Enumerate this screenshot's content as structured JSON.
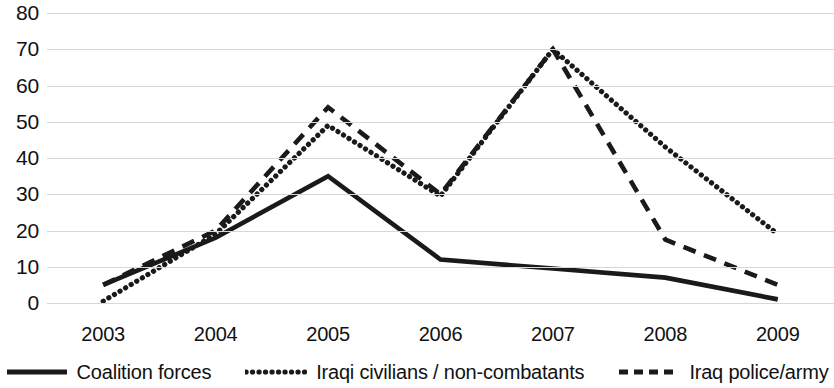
{
  "chart_data": {
    "type": "line",
    "title": "",
    "subtitle": "",
    "xlabel": "",
    "ylabel": "",
    "categories": [
      "2003",
      "2004",
      "2005",
      "2006",
      "2007",
      "2008",
      "2009"
    ],
    "ylim": [
      0,
      80
    ],
    "yticks": [
      0,
      10,
      20,
      30,
      40,
      50,
      60,
      70,
      80
    ],
    "ytick_labels": [
      "0",
      "10",
      "20",
      "30",
      "40",
      "50",
      "60",
      "70",
      "80"
    ],
    "grid": true,
    "legend_position": "bottom",
    "series": [
      {
        "name": "Coalition forces",
        "style": "solid",
        "color": "#1a1a1a",
        "values": [
          5,
          18,
          35,
          12,
          9.5,
          7,
          1
        ]
      },
      {
        "name": "Iraqi civilians / non-combatants",
        "style": "dotted",
        "color": "#1a1a1a",
        "values": [
          0.5,
          19,
          49,
          29.5,
          70,
          43,
          19
        ]
      },
      {
        "name": "Iraq police/army",
        "style": "dashed",
        "color": "#1a1a1a",
        "values": [
          5,
          20,
          54,
          30,
          70,
          17.5,
          5
        ]
      }
    ]
  },
  "axis": {
    "gridline_color": "#d7d7d7"
  }
}
